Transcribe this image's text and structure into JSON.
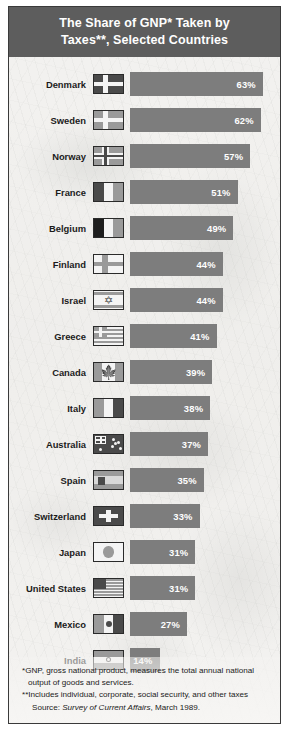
{
  "title": {
    "line1": "The Share of GNP* Taken by",
    "line2": "Taxes**, Selected Countries"
  },
  "colors": {
    "title_bg": "#5d5d5d",
    "bar": "#7d7d7d",
    "bar_label": "#ffffff",
    "page_bg": "#f2f1ef",
    "border": "#3a3a3a"
  },
  "notes": {
    "gnp_line1": "*GNP, gross national product, measures the total annual national",
    "gnp_line2": "output of goods and services.",
    "taxes": "**Includes individual, corporate, social security, and other taxes",
    "source_prefix": "Source: ",
    "source_italic": "Survey of Current Affairs",
    "source_suffix": ", March 1989."
  },
  "chart_data": {
    "type": "bar",
    "title": "The Share of GNP* Taken by Taxes**, Selected Countries",
    "xlabel": "",
    "ylabel": "",
    "orientation": "horizontal",
    "value_suffix": "%",
    "xlim": [
      0,
      63
    ],
    "grid": false,
    "legend": "none",
    "categories": [
      "Denmark",
      "Sweden",
      "Norway",
      "France",
      "Belgium",
      "Finland",
      "Israel",
      "Greece",
      "Canada",
      "Italy",
      "Australia",
      "Spain",
      "Switzerland",
      "Japan",
      "United States",
      "Mexico",
      "India"
    ],
    "values": [
      63,
      62,
      57,
      51,
      49,
      44,
      44,
      41,
      39,
      38,
      37,
      35,
      33,
      31,
      31,
      27,
      14
    ],
    "rows": [
      {
        "country": "Denmark",
        "value": 63,
        "label": "63%",
        "flag": "flag-denmark"
      },
      {
        "country": "Sweden",
        "value": 62,
        "label": "62%",
        "flag": "flag-sweden"
      },
      {
        "country": "Norway",
        "value": 57,
        "label": "57%",
        "flag": "flag-norway"
      },
      {
        "country": "France",
        "value": 51,
        "label": "51%",
        "flag": "flag-france"
      },
      {
        "country": "Belgium",
        "value": 49,
        "label": "49%",
        "flag": "flag-belgium"
      },
      {
        "country": "Finland",
        "value": 44,
        "label": "44%",
        "flag": "flag-finland"
      },
      {
        "country": "Israel",
        "value": 44,
        "label": "44%",
        "flag": "flag-israel"
      },
      {
        "country": "Greece",
        "value": 41,
        "label": "41%",
        "flag": "flag-greece"
      },
      {
        "country": "Canada",
        "value": 39,
        "label": "39%",
        "flag": "flag-canada"
      },
      {
        "country": "Italy",
        "value": 38,
        "label": "38%",
        "flag": "flag-italy"
      },
      {
        "country": "Australia",
        "value": 37,
        "label": "37%",
        "flag": "flag-australia"
      },
      {
        "country": "Spain",
        "value": 35,
        "label": "35%",
        "flag": "flag-spain"
      },
      {
        "country": "Switzerland",
        "value": 33,
        "label": "33%",
        "flag": "flag-switzerland"
      },
      {
        "country": "Japan",
        "value": 31,
        "label": "31%",
        "flag": "flag-japan"
      },
      {
        "country": "United States",
        "value": 31,
        "label": "31%",
        "flag": "flag-united-states"
      },
      {
        "country": "Mexico",
        "value": 27,
        "label": "27%",
        "flag": "flag-mexico"
      },
      {
        "country": "India",
        "value": 14,
        "label": "14%",
        "flag": "flag-india"
      }
    ]
  }
}
